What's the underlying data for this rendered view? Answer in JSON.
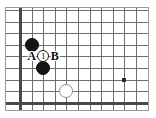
{
  "diagram": {
    "kind": "go-board-diagram",
    "board": {
      "width_px": 142,
      "height_px": 102,
      "origin_x": 14,
      "origin_y": 2,
      "cell": 11.6,
      "columns": 11,
      "rows": 9,
      "edges": [
        "left",
        "bottom"
      ],
      "grid_color": "#6f6f6f",
      "edge_color": "#4a4a4a",
      "background": "#ffffff"
    },
    "star_points": [
      {
        "name": "star-point-right",
        "col": 9,
        "row": 6
      }
    ],
    "stones": [
      {
        "name": "black-stone-upper",
        "color": "black",
        "col": 1,
        "row": 3,
        "radius": 7,
        "fill": "#151515"
      },
      {
        "name": "black-stone-lower",
        "color": "black",
        "col": 2,
        "row": 5,
        "radius": 7,
        "fill": "#151515"
      },
      {
        "name": "white-stone",
        "color": "white",
        "col": 4,
        "row": 7,
        "radius": 7,
        "fill": "#ffffff"
      }
    ],
    "markers": [
      {
        "name": "move-marker-1",
        "label": "1",
        "col": 2,
        "row": 4,
        "radius": 6
      }
    ],
    "labels": [
      {
        "name": "point-label-a",
        "text": "A",
        "col": 1,
        "row": 4
      },
      {
        "name": "point-label-b",
        "text": "B",
        "col": 3,
        "row": 4
      }
    ]
  }
}
